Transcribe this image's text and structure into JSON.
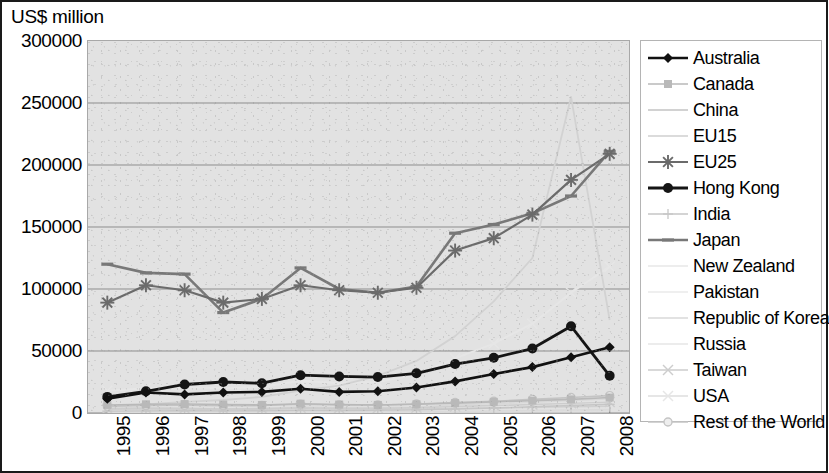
{
  "chart_data": {
    "type": "line",
    "title": "",
    "ylabel": "US$ million",
    "xlabel": "",
    "ylim": [
      0,
      300000
    ],
    "ytick_labels": [
      "300000",
      "250000",
      "200000",
      "150000",
      "100000",
      "50000",
      "0"
    ],
    "ytick_values": [
      300000,
      250000,
      200000,
      150000,
      100000,
      50000,
      0
    ],
    "grid": true,
    "legend_position": "right",
    "categories": [
      "1995",
      "1996",
      "1997",
      "1998",
      "1999",
      "2000",
      "2001",
      "2002",
      "2003",
      "2004",
      "2005",
      "2006",
      "2007",
      "2008"
    ],
    "series": [
      {
        "name": "Australia",
        "marker": "diamond",
        "color": "#111111",
        "width": 2.6,
        "values": [
          11500,
          16500,
          15000,
          16500,
          17000,
          19500,
          17000,
          17500,
          20500,
          25500,
          31500,
          37000,
          45000,
          53000
        ]
      },
      {
        "name": "Canada",
        "marker": "square",
        "color": "#b9b9b9",
        "width": 1.6,
        "values": [
          6500,
          7000,
          7200,
          6800,
          6500,
          7500,
          6800,
          6500,
          7000,
          8000,
          9000,
          10000,
          11000,
          12500
        ]
      },
      {
        "name": "China",
        "marker": "none",
        "color": "#d2d2d2",
        "width": 1.8,
        "values": [
          5000,
          7000,
          9000,
          10500,
          13000,
          18000,
          22000,
          30000,
          42000,
          62000,
          90000,
          125000,
          255000,
          75000
        ]
      },
      {
        "name": "EU15",
        "marker": "none",
        "color": "#cfcfcf",
        "width": 1.4,
        "values": [
          3000,
          3200,
          3000,
          2800,
          3000,
          3500,
          3200,
          3000,
          3200,
          3600,
          4000,
          4500,
          5000,
          5500
        ]
      },
      {
        "name": "EU25",
        "marker": "asterisk",
        "color": "#6b6b6b",
        "width": 2.2,
        "values": [
          89000,
          103000,
          99000,
          89000,
          92000,
          103000,
          99000,
          97000,
          101000,
          131000,
          141000,
          160000,
          188000,
          209000
        ]
      },
      {
        "name": "Hong Kong",
        "marker": "circle",
        "color": "#151515",
        "width": 2.8,
        "values": [
          13000,
          17500,
          23000,
          25000,
          24000,
          30500,
          29500,
          29000,
          32000,
          39500,
          44500,
          52000,
          70000,
          30000
        ]
      },
      {
        "name": "India",
        "marker": "plus",
        "color": "#c6c6c6",
        "width": 1.4,
        "values": [
          1500,
          1700,
          1800,
          1700,
          1800,
          2100,
          2000,
          2100,
          2500,
          3200,
          4000,
          5000,
          6000,
          7000
        ]
      },
      {
        "name": "Japan",
        "marker": "dash",
        "color": "#787878",
        "width": 2.6,
        "values": [
          120000,
          113000,
          112000,
          81000,
          92000,
          117000,
          100000,
          97000,
          102000,
          145000,
          152000,
          161000,
          175000,
          211000
        ]
      },
      {
        "name": "New Zealand",
        "marker": "none",
        "color": "#dcdcdc",
        "width": 1.2,
        "values": [
          900,
          1000,
          1000,
          900,
          950,
          1100,
          1000,
          1000,
          1100,
          1300,
          1500,
          1700,
          1900,
          2100
        ]
      },
      {
        "name": "Pakistan",
        "marker": "none",
        "color": "#e0e0e0",
        "width": 1.2,
        "values": [
          400,
          450,
          450,
          400,
          420,
          480,
          450,
          450,
          500,
          600,
          700,
          800,
          900,
          1000
        ]
      },
      {
        "name": "Republic of Korea",
        "marker": "none",
        "color": "#d8d8d8",
        "width": 1.3,
        "values": [
          4000,
          4500,
          4200,
          3500,
          4000,
          5000,
          4500,
          4500,
          5000,
          6500,
          7500,
          8500,
          10000,
          11500
        ]
      },
      {
        "name": "Russia",
        "marker": "none",
        "color": "#dadada",
        "width": 1.2,
        "values": [
          700,
          800,
          800,
          700,
          750,
          900,
          850,
          900,
          1100,
          1400,
          1700,
          2100,
          2600,
          3000
        ]
      },
      {
        "name": "Taiwan",
        "marker": "x",
        "color": "#cdcdcd",
        "width": 1.4,
        "values": [
          3500,
          3800,
          3600,
          3200,
          3500,
          4200,
          3800,
          3800,
          4200,
          5200,
          6000,
          6800,
          7800,
          8800
        ]
      },
      {
        "name": "USA",
        "marker": "x",
        "color": "#e6e6e6",
        "width": 2.0,
        "values": [
          18000,
          20000,
          21000,
          20000,
          21000,
          26000,
          24000,
          25000,
          31000,
          44000,
          56000,
          72000,
          97000,
          118000
        ]
      },
      {
        "name": "Rest of the World",
        "marker": "circle-open",
        "color": "#c4c4c4",
        "width": 1.6,
        "values": [
          5500,
          6000,
          6200,
          5800,
          6000,
          7000,
          6500,
          6500,
          7200,
          8500,
          9500,
          11000,
          12500,
          14000
        ]
      }
    ]
  },
  "legend": {
    "items": [
      {
        "label": "Australia"
      },
      {
        "label": "Canada"
      },
      {
        "label": "China"
      },
      {
        "label": "EU15"
      },
      {
        "label": "EU25"
      },
      {
        "label": "Hong Kong"
      },
      {
        "label": "India"
      },
      {
        "label": "Japan"
      },
      {
        "label": "New Zealand"
      },
      {
        "label": "Pakistan"
      },
      {
        "label": "Republic of Korea"
      },
      {
        "label": "Russia"
      },
      {
        "label": "Taiwan"
      },
      {
        "label": "USA"
      },
      {
        "label": "Rest of the World"
      }
    ]
  }
}
